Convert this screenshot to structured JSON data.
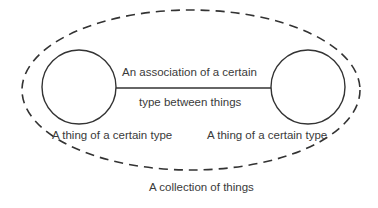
{
  "diagram": {
    "collection_label": "A collection of things",
    "association_label_line1": "An association of a certain",
    "association_label_line2": "type between things",
    "left_thing_label": "A thing of a certain type",
    "right_thing_label": "A thing of a certain type",
    "colors": {
      "stroke": "#333333",
      "text": "#3a3a3a",
      "background": "#ffffff"
    }
  }
}
